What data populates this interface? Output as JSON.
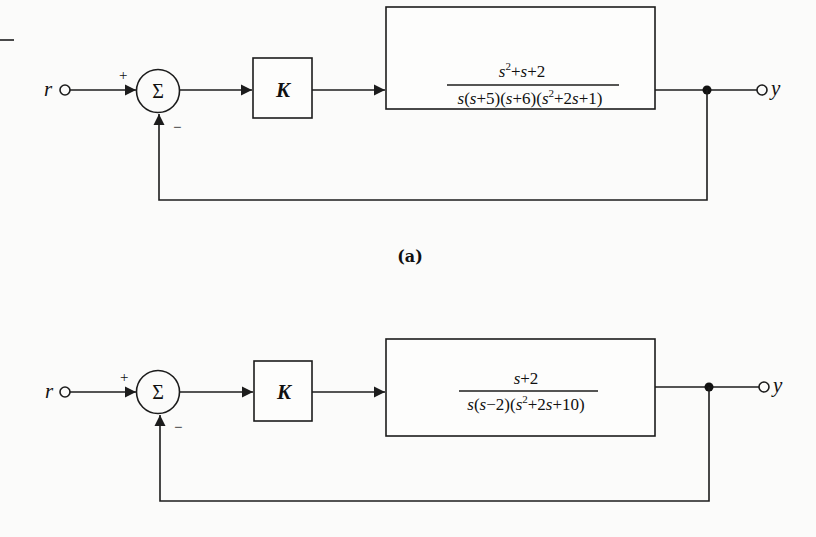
{
  "figure": {
    "top_left_mark": "—",
    "diagrams": [
      {
        "id": "a",
        "caption": "(a)",
        "input_label": "r",
        "output_label": "y",
        "summing_junction": {
          "symbol": "Σ",
          "plus_sign": "+",
          "minus_sign": "−"
        },
        "gain_block": {
          "label": "K"
        },
        "plant_block": {
          "numerator": {
            "text": "s²+s+2"
          },
          "denominator": {
            "text": "s(s+5)(s+6)(s²+2s+1)"
          }
        }
      },
      {
        "id": "b",
        "caption": "",
        "input_label": "r",
        "output_label": "y",
        "summing_junction": {
          "symbol": "Σ",
          "plus_sign": "+",
          "minus_sign": "−"
        },
        "gain_block": {
          "label": "K"
        },
        "plant_block": {
          "numerator": {
            "text": "s+2"
          },
          "denominator": {
            "text": "s(s−2)(s²+2s+10)"
          }
        }
      }
    ]
  }
}
